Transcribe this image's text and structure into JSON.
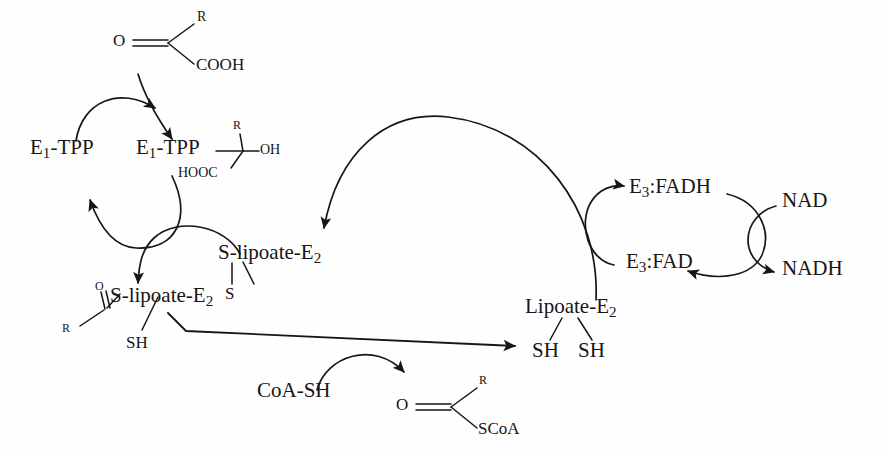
{
  "diagram": {
    "type": "biochemical-pathway",
    "background_color": "#fefefe",
    "stroke_color": "#161616"
  },
  "nodes": {
    "substrate": {
      "oxygen": "O",
      "r_group": "R",
      "carboxyl": "COOH"
    },
    "e1_tpp_free": {
      "label_main": "E",
      "label_sub": "1",
      "label_rest": "-TPP"
    },
    "e1_tpp_bound": {
      "label_main": "E",
      "label_sub": "1",
      "label_rest": "-TPP"
    },
    "hydroxyalkyl": {
      "r_group": "R",
      "hydroxyl": "OH",
      "carboxyl": "HOOC"
    },
    "lipoate_disulfide": {
      "label_main": "S-lipoate-E",
      "label_sub": "2",
      "sulfur": "S"
    },
    "acyl_lipoate": {
      "oxygen": "O",
      "r_group": "R",
      "label_main": "S-lipoate-E",
      "label_sub": "2",
      "thiol": "SH"
    },
    "dihydrolipoate": {
      "label_main": "Lipoate-E",
      "label_sub": "2",
      "thiol_left": "SH",
      "thiol_right": "SH"
    },
    "coash": {
      "label": "CoA-SH"
    },
    "acyl_coa": {
      "oxygen": "O",
      "r_group": "R",
      "thioester": "SCoA"
    },
    "e3_fadh": {
      "label_main": "E",
      "label_sub": "3",
      "label_rest": ":FADH"
    },
    "e3_fad": {
      "label_main": "E",
      "label_sub": "3",
      "label_rest": ":FAD"
    },
    "nad": {
      "label": "NAD"
    },
    "nadh": {
      "label": "NADH"
    }
  },
  "arrows": [
    {
      "name": "substrate-to-e1",
      "from": "substrate",
      "to": "e1_tpp_bound"
    },
    {
      "name": "e1-regeneration-in",
      "from": "e1_tpp_free",
      "to": "substrate-junction"
    },
    {
      "name": "e1-regeneration-out",
      "from": "e1_tpp_bound",
      "to": "e1_tpp_free"
    },
    {
      "name": "lipoate-to-acyl",
      "from": "lipoate_disulfide",
      "to": "acyl_lipoate"
    },
    {
      "name": "acyl-transfer",
      "from": "acyl_lipoate",
      "to": "dihydrolipoate"
    },
    {
      "name": "coash-entry",
      "from": "coash",
      "to": "acyl_coa"
    },
    {
      "name": "dihydrolipoate-to-lipoate",
      "from": "dihydrolipoate",
      "to": "lipoate_disulfide"
    },
    {
      "name": "fad-to-fadh",
      "from": "e3_fad",
      "to": "e3_fadh"
    },
    {
      "name": "fadh-to-fad",
      "from": "e3_fadh",
      "to": "e3_fad"
    },
    {
      "name": "nad-to-nadh",
      "from": "nad",
      "to": "nadh"
    }
  ]
}
